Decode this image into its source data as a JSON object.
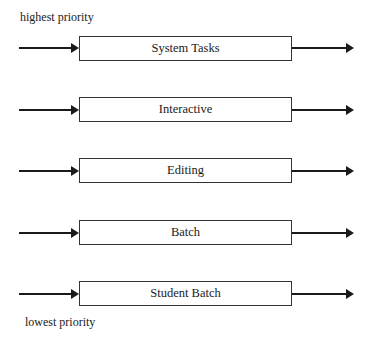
{
  "diagram": {
    "top_label": "highest priority",
    "bottom_label": "lowest priority",
    "queues": [
      {
        "label": "System Tasks",
        "top": 36
      },
      {
        "label": "Interactive",
        "top": 97
      },
      {
        "label": "Editing",
        "top": 158
      },
      {
        "label": "Batch",
        "top": 220
      },
      {
        "label": "Student Batch",
        "top": 281
      }
    ]
  }
}
